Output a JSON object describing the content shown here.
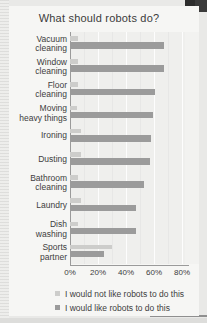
{
  "chart_data": {
    "type": "bar",
    "orientation": "horizontal",
    "title": "What should robots do?",
    "xlabel": "",
    "ylabel": "",
    "xlim": [
      0,
      85
    ],
    "grid": true,
    "legend_position": "bottom-left",
    "tick_labels": [
      "0%",
      "20%",
      "40%",
      "60%",
      "80%"
    ],
    "tick_values": [
      0,
      20,
      40,
      60,
      80
    ],
    "categories": [
      "Vacuum\ncleaning",
      "Window\ncleaning",
      "Floor\ncleaning",
      "Moving\nheavy things",
      "Ironing",
      "Dusting",
      "Bathroom\ncleaning",
      "Laundry",
      "Dish\nwashing",
      "Sports\npartner"
    ],
    "series": [
      {
        "name": "I would not like robots to do this",
        "color": "#cdcdcb",
        "values": [
          6,
          6,
          6,
          5,
          8,
          8,
          6,
          8,
          6,
          30
        ]
      },
      {
        "name": "I would like robots to do this",
        "color": "#9b9b9b",
        "values": [
          67,
          67,
          61,
          59,
          58,
          57,
          53,
          47,
          47,
          24
        ]
      }
    ]
  },
  "legend": {
    "items": [
      {
        "label": "I would not like robots to do this",
        "swatch": "light"
      },
      {
        "label": "I would like robots to do this",
        "swatch": "dark"
      }
    ]
  }
}
